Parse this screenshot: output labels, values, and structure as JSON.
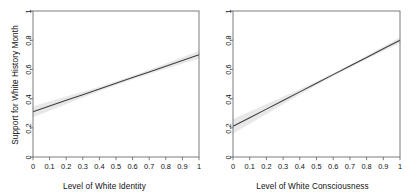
{
  "figure": {
    "background": "#ffffff",
    "line_color": "#3d3d3d",
    "band_color": "#e8e8e8",
    "axis_color": "#6e6e6e"
  },
  "chart_data": [
    {
      "type": "line",
      "panel": "left",
      "title": "",
      "xlabel": "Level of White Identity",
      "ylabel": "Support for White History Month",
      "xlim": [
        0,
        1
      ],
      "ylim": [
        0,
        1
      ],
      "grid": false,
      "legend": "none",
      "xticks": [
        0,
        0.1,
        0.2,
        0.3,
        0.4,
        0.5,
        0.6,
        0.7,
        0.8,
        0.9,
        1
      ],
      "xticklabels": [
        "0",
        "0.1",
        "0.2",
        "0.3",
        "0.4",
        "0.5",
        "0.6",
        "0.7",
        "0.8",
        "0.9",
        "1"
      ],
      "yticks": [
        0,
        0.2,
        0.4,
        0.6,
        0.8,
        1
      ],
      "yticklabels": [
        "0",
        "0.2",
        "0.4",
        "0.6",
        "0.8",
        "1"
      ],
      "series": [
        {
          "name": "fitted",
          "x": [
            0,
            0.1,
            0.2,
            0.3,
            0.4,
            0.5,
            0.6,
            0.7,
            0.8,
            0.9,
            1
          ],
          "values": [
            0.31,
            0.349,
            0.388,
            0.427,
            0.466,
            0.505,
            0.544,
            0.583,
            0.622,
            0.661,
            0.7
          ]
        },
        {
          "name": "ci_upper",
          "x": [
            0,
            0.1,
            0.2,
            0.3,
            0.4,
            0.5,
            0.6,
            0.7,
            0.8,
            0.9,
            1
          ],
          "values": [
            0.345,
            0.379,
            0.412,
            0.445,
            0.479,
            0.515,
            0.554,
            0.596,
            0.638,
            0.681,
            0.724
          ]
        },
        {
          "name": "ci_lower",
          "x": [
            0,
            0.1,
            0.2,
            0.3,
            0.4,
            0.5,
            0.6,
            0.7,
            0.8,
            0.9,
            1
          ],
          "values": [
            0.275,
            0.319,
            0.364,
            0.409,
            0.453,
            0.495,
            0.534,
            0.57,
            0.606,
            0.641,
            0.676
          ]
        }
      ]
    },
    {
      "type": "line",
      "panel": "right",
      "title": "",
      "xlabel": "Level of White Consciousness",
      "ylabel": "",
      "xlim": [
        0,
        1
      ],
      "ylim": [
        0,
        1
      ],
      "grid": false,
      "legend": "none",
      "xticks": [
        0,
        0.1,
        0.2,
        0.3,
        0.4,
        0.5,
        0.6,
        0.7,
        0.8,
        0.9,
        1
      ],
      "xticklabels": [
        "0",
        "0.1",
        "0.2",
        "0.3",
        "0.4",
        "0.5",
        "0.6",
        "0.7",
        "0.8",
        "0.9",
        "1"
      ],
      "yticks": [
        0,
        0.2,
        0.4,
        0.6,
        0.8,
        1
      ],
      "yticklabels": [
        "0",
        "0.2",
        "0.4",
        "0.6",
        "0.8",
        "1"
      ],
      "series": [
        {
          "name": "fitted",
          "x": [
            0,
            0.1,
            0.2,
            0.3,
            0.4,
            0.5,
            0.6,
            0.7,
            0.8,
            0.9,
            1
          ],
          "values": [
            0.21,
            0.269,
            0.328,
            0.387,
            0.446,
            0.505,
            0.564,
            0.623,
            0.682,
            0.741,
            0.8
          ]
        },
        {
          "name": "ci_upper",
          "x": [
            0,
            0.1,
            0.2,
            0.3,
            0.4,
            0.5,
            0.6,
            0.7,
            0.8,
            0.9,
            1
          ],
          "values": [
            0.258,
            0.309,
            0.36,
            0.411,
            0.463,
            0.516,
            0.572,
            0.631,
            0.692,
            0.754,
            0.818
          ]
        },
        {
          "name": "ci_lower",
          "x": [
            0,
            0.1,
            0.2,
            0.3,
            0.4,
            0.5,
            0.6,
            0.7,
            0.8,
            0.9,
            1
          ],
          "values": [
            0.162,
            0.229,
            0.296,
            0.363,
            0.429,
            0.494,
            0.556,
            0.615,
            0.672,
            0.728,
            0.782
          ]
        }
      ]
    }
  ]
}
